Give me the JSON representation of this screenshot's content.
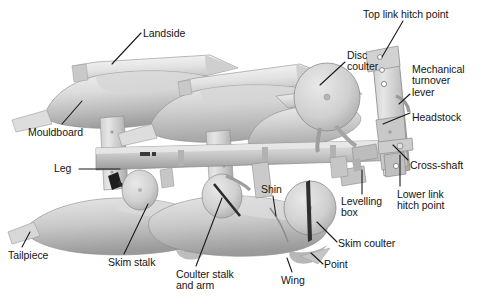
{
  "figure": {
    "media_type": "black-and-white photograph",
    "width": 481,
    "height": 308,
    "background_color": "#ffffff",
    "label_color": "#141414",
    "leader_color": "#1a1a1a"
  },
  "labels": [
    {
      "id": "landside",
      "text": "Landside",
      "lines": [
        "Landside"
      ],
      "x": 143,
      "y": 28,
      "align": "left"
    },
    {
      "id": "mouldboard",
      "text": "Mouldboard",
      "lines": [
        "Mouldboard"
      ],
      "x": 28,
      "y": 127,
      "align": "left"
    },
    {
      "id": "leg",
      "text": "Leg",
      "lines": [
        "Leg"
      ],
      "x": 54,
      "y": 163,
      "align": "left"
    },
    {
      "id": "tailpiece",
      "text": "Tailpiece",
      "lines": [
        "Tailpiece"
      ],
      "x": 8,
      "y": 250,
      "align": "left"
    },
    {
      "id": "skim-stalk",
      "text": "Skim stalk",
      "lines": [
        "Skim stalk"
      ],
      "x": 108,
      "y": 257,
      "align": "left"
    },
    {
      "id": "coulter-stalk",
      "text": "Coulter stalk and arm",
      "lines": [
        "Coulter stalk",
        "and arm"
      ],
      "x": 176,
      "y": 269,
      "align": "left"
    },
    {
      "id": "wing",
      "text": "Wing",
      "lines": [
        "Wing"
      ],
      "x": 281,
      "y": 275,
      "align": "left"
    },
    {
      "id": "point",
      "text": "Point",
      "lines": [
        "Point"
      ],
      "x": 324,
      "y": 259,
      "align": "left"
    },
    {
      "id": "shin",
      "text": "Shin",
      "lines": [
        "Shin"
      ],
      "x": 261,
      "y": 184,
      "align": "left"
    },
    {
      "id": "levelling-box",
      "text": "Levelling box",
      "lines": [
        "Levelling",
        "box"
      ],
      "x": 341,
      "y": 196,
      "align": "left"
    },
    {
      "id": "skim-coulter",
      "text": "Skim coulter",
      "lines": [
        "Skim coulter"
      ],
      "x": 338,
      "y": 238,
      "align": "left"
    },
    {
      "id": "disc-coulter",
      "text": "Disc coulter",
      "lines": [
        "Disc",
        "coulter"
      ],
      "x": 347,
      "y": 50,
      "align": "left"
    },
    {
      "id": "top-link-hitch",
      "text": "Top link hitch point",
      "lines": [
        "Top link hitch point"
      ],
      "x": 363,
      "y": 9,
      "align": "left"
    },
    {
      "id": "mechanical-lever",
      "text": "Mechanical turnover lever",
      "lines": [
        "Mechanical",
        "turnover",
        "lever"
      ],
      "x": 412,
      "y": 64,
      "align": "left"
    },
    {
      "id": "headstock",
      "text": "Headstock",
      "lines": [
        "Headstock"
      ],
      "x": 412,
      "y": 112,
      "align": "left"
    },
    {
      "id": "cross-shaft",
      "text": "Cross-shaft",
      "lines": [
        "Cross-shaft"
      ],
      "x": 410,
      "y": 160,
      "align": "left"
    },
    {
      "id": "lower-link-hitch",
      "text": "Lower link hitch point",
      "lines": [
        "Lower link",
        "hitch point"
      ],
      "x": 397,
      "y": 189,
      "align": "left"
    }
  ],
  "leader_lines": [
    {
      "id": "landside-leader",
      "from": [
        141,
        33
      ],
      "to": [
        112,
        64
      ]
    },
    {
      "id": "mouldboard-leader",
      "from": [
        62,
        124
      ],
      "to": [
        82,
        101
      ]
    },
    {
      "id": "leg-leader",
      "from": [
        79,
        169
      ],
      "to": [
        120,
        169
      ]
    },
    {
      "id": "tailpiece-leader",
      "from": [
        22,
        247
      ],
      "to": [
        30,
        232
      ]
    },
    {
      "id": "skim-stalk-leader",
      "from": [
        124,
        254
      ],
      "to": [
        148,
        204
      ]
    },
    {
      "id": "coulter-stalk-leader",
      "from": [
        196,
        266
      ],
      "to": [
        222,
        198
      ]
    },
    {
      "id": "wing-leader",
      "from": [
        292,
        272
      ],
      "to": [
        287,
        258
      ]
    },
    {
      "id": "point-leader",
      "from": [
        323,
        264
      ],
      "to": [
        311,
        253
      ]
    },
    {
      "id": "shin-leader",
      "from": [
        273,
        196
      ],
      "to": [
        276,
        216
      ]
    },
    {
      "id": "levelling-box-leader",
      "from": [
        362,
        194
      ],
      "to": [
        362,
        170
      ]
    },
    {
      "id": "skim-coulter-leader",
      "from": [
        337,
        242
      ],
      "to": [
        317,
        222
      ]
    },
    {
      "id": "disc-coulter-leader",
      "from": [
        345,
        62
      ],
      "to": [
        320,
        85
      ]
    },
    {
      "id": "top-link-leader",
      "from": [
        403,
        21
      ],
      "to": [
        382,
        57
      ]
    },
    {
      "id": "mechanical-lever-leader",
      "from": [
        410,
        94
      ],
      "to": [
        399,
        104
      ]
    },
    {
      "id": "headstock-leader",
      "from": [
        410,
        113
      ],
      "to": [
        383,
        124
      ]
    },
    {
      "id": "cross-shaft-leader",
      "from": [
        408,
        160
      ],
      "to": [
        393,
        145
      ]
    },
    {
      "id": "lower-link-leader",
      "from": [
        400,
        186
      ],
      "to": [
        400,
        155
      ]
    }
  ],
  "parts_list": [
    "Landside",
    "Mouldboard",
    "Leg",
    "Tailpiece",
    "Skim stalk",
    "Coulter stalk and arm",
    "Wing",
    "Point",
    "Shin",
    "Levelling box",
    "Skim coulter",
    "Disc coulter",
    "Top link hitch point",
    "Mechanical turnover lever",
    "Headstock",
    "Cross-shaft",
    "Lower link hitch point"
  ]
}
